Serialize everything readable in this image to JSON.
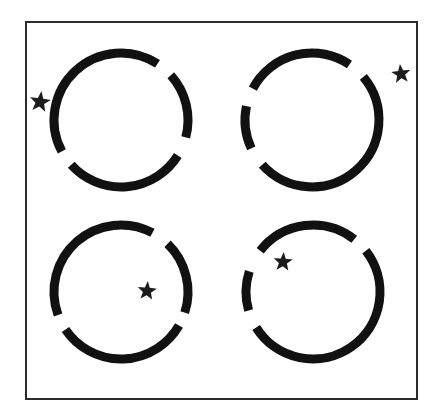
{
  "figure": {
    "title": "Broken circles with star markers",
    "width": 438,
    "height": 420,
    "background_color": "#ffffff",
    "ink_color": "#111111"
  },
  "frame": {
    "label": "outer rectangle border",
    "x": 25,
    "y": 21,
    "width": 393,
    "height": 379,
    "stroke_width": 2,
    "stroke_color": "#2b2b2b",
    "fill": "none"
  },
  "circles": [
    {
      "id": "top-left",
      "label": "Top-left broken circle",
      "cx": 121,
      "cy": 120,
      "r": 67,
      "stroke_width": 9,
      "stroke_color": "#111111",
      "arcs": [
        {
          "start_deg": 57,
          "end_deg": 208
        },
        {
          "start_deg": 222,
          "end_deg": 328
        },
        {
          "start_deg": 345,
          "end_deg": 42
        }
      ]
    },
    {
      "id": "top-right",
      "label": "Top-right broken circle",
      "cx": 312,
      "cy": 120,
      "r": 67,
      "stroke_width": 9,
      "stroke_color": "#111111",
      "arcs": [
        {
          "start_deg": 56,
          "end_deg": 152
        },
        {
          "start_deg": 168,
          "end_deg": 205
        },
        {
          "start_deg": 222,
          "end_deg": 40
        }
      ]
    },
    {
      "id": "bottom-left",
      "label": "Bottom-left broken circle",
      "cx": 121,
      "cy": 292,
      "r": 67,
      "stroke_width": 9,
      "stroke_color": "#111111",
      "arcs": [
        {
          "start_deg": 62,
          "end_deg": 200
        },
        {
          "start_deg": 214,
          "end_deg": 330
        },
        {
          "start_deg": 342,
          "end_deg": 46
        }
      ]
    },
    {
      "id": "bottom-right",
      "label": "Bottom-right broken circle",
      "cx": 313,
      "cy": 292,
      "r": 67,
      "stroke_width": 9,
      "stroke_color": "#111111",
      "arcs": [
        {
          "start_deg": 52,
          "end_deg": 142
        },
        {
          "start_deg": 162,
          "end_deg": 196
        },
        {
          "start_deg": 212,
          "end_deg": 38
        }
      ]
    }
  ],
  "stars": [
    {
      "id": "star-top-left",
      "label": "Star outside top-left circle, upper-left",
      "cx": 40,
      "cy": 102,
      "outer_r": 11,
      "inner_r": 4.6,
      "rotation_deg": -8,
      "fill": "#1c1c1c"
    },
    {
      "id": "star-top-right",
      "label": "Star outside top-right circle, upper-right corner",
      "cx": 401,
      "cy": 74,
      "outer_r": 10,
      "inner_r": 4.2,
      "rotation_deg": 6,
      "fill": "#1c1c1c"
    },
    {
      "id": "star-bottom-left",
      "label": "Star inside bottom-left circle, near center",
      "cx": 147,
      "cy": 291,
      "outer_r": 10,
      "inner_r": 4.2,
      "rotation_deg": -5,
      "fill": "#1c1c1c"
    },
    {
      "id": "star-bottom-right",
      "label": "Star inside bottom-right circle, upper-left region",
      "cx": 283,
      "cy": 262,
      "outer_r": 10,
      "inner_r": 4.2,
      "rotation_deg": -4,
      "fill": "#1c1c1c"
    }
  ]
}
